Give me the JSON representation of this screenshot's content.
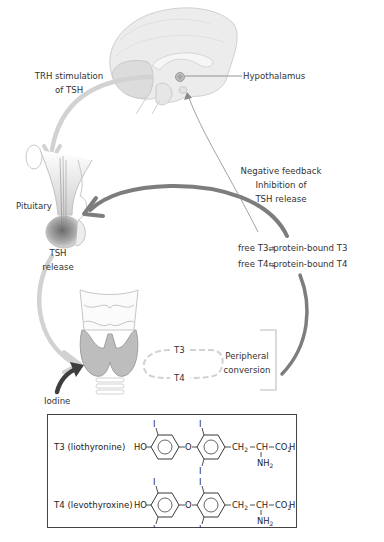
{
  "diagram": {
    "labels": {
      "trh": [
        "TRH stimulation",
        "of TSH"
      ],
      "hypothalamus": "Hypothalamus",
      "negative_feedback": [
        "Negative feedback",
        "Inhibition of",
        "TSH release"
      ],
      "pituitary": "Pituitary",
      "tsh_release": [
        "TSH",
        "release"
      ],
      "equilibrium_t3": {
        "left": "free T3",
        "right": "protein-bound T3"
      },
      "equilibrium_t4": {
        "left": "free T4",
        "right": "protein-bound T4"
      },
      "t3": "T3",
      "t4": "T4",
      "peripheral": [
        "Peripheral",
        "conversion"
      ],
      "iodine": "Iodine"
    },
    "structures": {
      "t3": {
        "name": "T3 (liothyronine)",
        "ring1_substituents": [
          "I"
        ],
        "ring2_substituents": [
          "I",
          "I"
        ]
      },
      "t4": {
        "name": "T4 (levothyroxine)",
        "ring1_substituents": [
          "I",
          "I"
        ],
        "ring2_substituents": [
          "I",
          "I"
        ]
      },
      "common": {
        "hydroxyl": "HO",
        "ether": "O",
        "iodine": "I",
        "ch2": "CH",
        "ch2_sub": "2",
        "ch": "CH",
        "co2h_a": "CO",
        "co2h_sub": "2",
        "co2h_b": "H",
        "nh2": "NH",
        "nh2_sub": "2"
      }
    },
    "colors": {
      "feedback_arrow": "#7a7a7a",
      "stimulation_arrow": "#d4d4d4",
      "iodine_arrow": "#3e3e3e",
      "gland_fill": "#bdbdbd",
      "box_border": "#444444"
    }
  }
}
